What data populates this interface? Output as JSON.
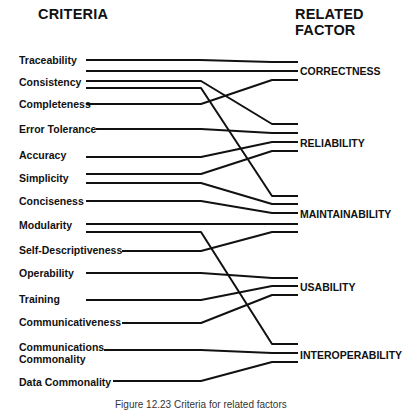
{
  "headers": {
    "left": "CRITERIA",
    "right": "RELATED FACTOR"
  },
  "criteria": [
    {
      "label": "Traceability",
      "x": 19,
      "y": 54
    },
    {
      "label": "Consistency",
      "x": 19,
      "y": 76
    },
    {
      "label": "Completeness",
      "x": 19,
      "y": 98
    },
    {
      "label": "Error Tolerance",
      "x": 19,
      "y": 123
    },
    {
      "label": "Accuracy",
      "x": 19,
      "y": 149
    },
    {
      "label": "Simplicity",
      "x": 19,
      "y": 172
    },
    {
      "label": "Conciseness",
      "x": 19,
      "y": 195
    },
    {
      "label": "Modularity",
      "x": 19,
      "y": 219
    },
    {
      "label": "Self-Descriptiveness",
      "x": 19,
      "y": 244
    },
    {
      "label": "Operability",
      "x": 19,
      "y": 267
    },
    {
      "label": "Training",
      "x": 19,
      "y": 293
    },
    {
      "label": "Communicativeness",
      "x": 19,
      "y": 316
    },
    {
      "label": "Communications",
      "x": 19,
      "y": 341
    },
    {
      "label": "Commonality",
      "x": 19,
      "y": 353
    },
    {
      "label": "Data Commonality",
      "x": 19,
      "y": 376
    }
  ],
  "factors": [
    {
      "label": "CORRECTNESS",
      "x": 300,
      "y": 65
    },
    {
      "label": "RELIABILITY",
      "x": 300,
      "y": 137
    },
    {
      "label": "MAINTAINABILITY",
      "x": 300,
      "y": 208
    },
    {
      "label": "USABILITY",
      "x": 300,
      "y": 281
    },
    {
      "label": "INTEROPERABILITY",
      "x": 300,
      "y": 349
    }
  ],
  "connections": [
    {
      "from": "Traceability",
      "to": "CORRECTNESS",
      "points": "86,60 200,60 272,62 298,62"
    },
    {
      "from": "Consistency",
      "to": "CORRECTNESS",
      "points": "86,71 272,71 298,71"
    },
    {
      "from": "Consistency",
      "to": "RELIABILITY",
      "points": "86,81 201,81 272,124 298,124"
    },
    {
      "from": "Consistency",
      "to": "MAINTAINABILITY",
      "points": "86,88 201,88 272,196 298,196"
    },
    {
      "from": "Completeness",
      "to": "CORRECTNESS",
      "points": "86,104 201,104 272,80 298,80"
    },
    {
      "from": "Error Tolerance",
      "to": "RELIABILITY",
      "points": "96,129 201,129 272,133 298,133"
    },
    {
      "from": "Accuracy",
      "to": "RELIABILITY",
      "points": "86,157 201,157 272,142 298,142"
    },
    {
      "from": "Simplicity",
      "to": "RELIABILITY",
      "points": "86,174 201,174 272,151 298,151"
    },
    {
      "from": "Simplicity",
      "to": "MAINTAINABILITY",
      "points": "86,183 201,183 272,204 298,204"
    },
    {
      "from": "Conciseness",
      "to": "MAINTAINABILITY",
      "points": "86,201 201,201 272,213 298,213"
    },
    {
      "from": "Modularity",
      "to": "MAINTAINABILITY",
      "points": "86,224 298,224"
    },
    {
      "from": "Modularity",
      "to": "INTEROPERABILITY",
      "points": "86,232 201,232 272,344 298,344"
    },
    {
      "from": "Self-Descriptiveness",
      "to": "MAINTAINABILITY",
      "points": "122,251 201,251 272,232 298,232"
    },
    {
      "from": "Operability",
      "to": "USABILITY",
      "points": "86,273 201,273 272,278 298,278"
    },
    {
      "from": "Training",
      "to": "USABILITY",
      "points": "86,300 201,300 272,286 298,286"
    },
    {
      "from": "Communicativeness",
      "to": "USABILITY",
      "points": "122,323 201,323 272,295 298,295"
    },
    {
      "from": "Communications Commonality",
      "to": "INTEROPERABILITY",
      "points": "104,350 201,350 272,353 298,353"
    },
    {
      "from": "Data Commonality",
      "to": "INTEROPERABILITY",
      "points": "113,381 201,381 272,362 298,362"
    }
  ],
  "caption": "Figure 12.23   Criteria for related factors"
}
